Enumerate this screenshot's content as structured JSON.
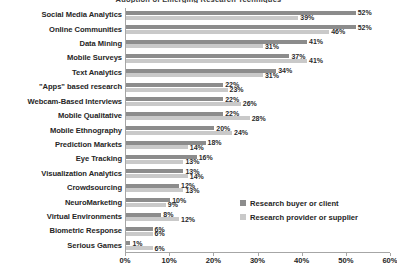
{
  "chart_data": {
    "type": "bar",
    "orientation": "horizontal",
    "title": "Adoption of Emerging Research Techniques",
    "xlabel": "",
    "ylabel": "",
    "xlim": [
      0,
      60
    ],
    "xticks": [
      "0%",
      "10%",
      "20%",
      "30%",
      "40%",
      "50%",
      "60%"
    ],
    "xtick_values": [
      0,
      10,
      20,
      30,
      40,
      50,
      60
    ],
    "grid": false,
    "legend_position": "inside-lower-right",
    "value_suffix": "%",
    "categories": [
      "Social Media Analytics",
      "Online Communities",
      "Data Mining",
      "Mobile Surveys",
      "Text Analytics",
      "\"Apps\" based research",
      "Webcam-Based Interviews",
      "Mobile Qualitative",
      "Mobile Ethnography",
      "Prediction Markets",
      "Eye Tracking",
      "Visualization Analytics",
      "Crowdsourcing",
      "NeuroMarketing",
      "Virtual Environments",
      "Biometric Response",
      "Serious Games"
    ],
    "series": [
      {
        "name": "Research buyer or client",
        "color": "#8c8c8c",
        "values": [
          52,
          52,
          41,
          37,
          34,
          22,
          22,
          22,
          20,
          18,
          16,
          13,
          12,
          10,
          8,
          6,
          1
        ],
        "labels": [
          "52%",
          "52%",
          "41%",
          "37%",
          "34%",
          "22%",
          "22%",
          "22%",
          "20%",
          "18%",
          "16%",
          "13%",
          "12%",
          "10%",
          "8%",
          "6%",
          "1%"
        ]
      },
      {
        "name": "Research provider or supplier",
        "color": "#c9c9c9",
        "values": [
          39,
          46,
          31,
          41,
          31,
          23,
          26,
          28,
          24,
          14,
          13,
          14,
          13,
          9,
          12,
          6,
          6
        ],
        "labels": [
          "39%",
          "46%",
          "31%",
          "41%",
          "31%",
          "23%",
          "26%",
          "28%",
          "24%",
          "14%",
          "13%",
          "14%",
          "13%",
          "9%",
          "12%",
          "6%",
          "6%"
        ]
      }
    ]
  },
  "legend": {
    "items": [
      {
        "label": "Research buyer or client",
        "color": "#8c8c8c"
      },
      {
        "label": "Research provider or supplier",
        "color": "#c9c9c9"
      }
    ]
  }
}
